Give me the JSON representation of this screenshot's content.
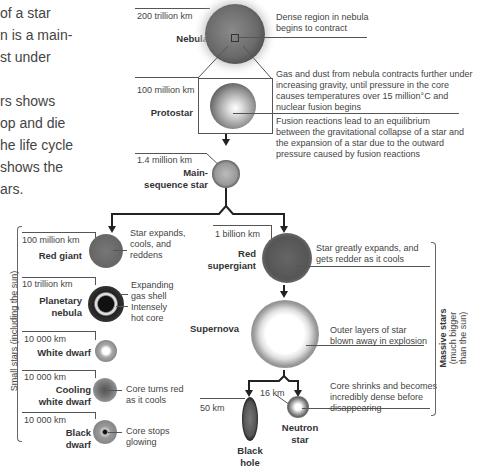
{
  "intro": {
    "para1": [
      "of a star",
      "n is a main-",
      "st under"
    ],
    "para2": [
      "rs shows",
      "op and die",
      "he life cycle",
      "shows the",
      "ars."
    ]
  },
  "stages": {
    "nebula": {
      "size": "200 trillion km",
      "name": "Nebula",
      "desc": "Dense region in nebula begins to contract"
    },
    "protostar": {
      "size": "100 million km",
      "name": "Protostar",
      "desc": "Gas and dust from nebula contracts further under increasing gravity, until pressure in the core causes temperatures over 15 million°C and nuclear fusion begins"
    },
    "main_sequence": {
      "size": "1.4 million km",
      "name_line1": "Main-",
      "name_line2": "sequence star",
      "desc": "Fusion reactions lead to an equilibrium between the gravitational collapse of a star and the expansion of a star due to the outward pressure caused by fusion reactions"
    }
  },
  "small_stars": {
    "group_label": "Small stars (including the sun)",
    "red_giant": {
      "size": "100 million km",
      "name": "Red giant",
      "desc": "Star expands, cools, and reddens"
    },
    "planetary_nebula": {
      "size": "10 trillion km",
      "name_line1": "Planetary",
      "name_line2": "nebula",
      "desc_shell": "Expanding gas shell",
      "desc_core": "Intensely hot core"
    },
    "white_dwarf": {
      "size": "10 000 km",
      "name": "White dwarf"
    },
    "cooling_white_dwarf": {
      "size": "10 000 km",
      "name_line1": "Cooling",
      "name_line2": "white dwarf",
      "desc": "Core turns red as it cools"
    },
    "black_dwarf": {
      "size": "10 000 km",
      "name_line1": "Black",
      "name_line2": "dwarf",
      "desc": "Core stops glowing"
    }
  },
  "massive_stars": {
    "group_label_1": "Massive stars",
    "group_label_2": "(much bigger",
    "group_label_3": "than the sun)",
    "red_supergiant": {
      "size": "1 billion km",
      "name_line1": "Red",
      "name_line2": "supergiant",
      "desc": "Star greatly expands, and gets redder as it cools"
    },
    "supernova": {
      "name": "Supernova",
      "desc": "Outer layers of star blown away in explosion"
    },
    "black_hole": {
      "size": "50 km",
      "name_line1": "Black",
      "name_line2": "hole"
    },
    "neutron_star": {
      "size": "16 km",
      "name_line1": "Neutron",
      "name_line2": "star",
      "desc": "Core shrinks and becomes incredibly dense before disappearing"
    }
  }
}
